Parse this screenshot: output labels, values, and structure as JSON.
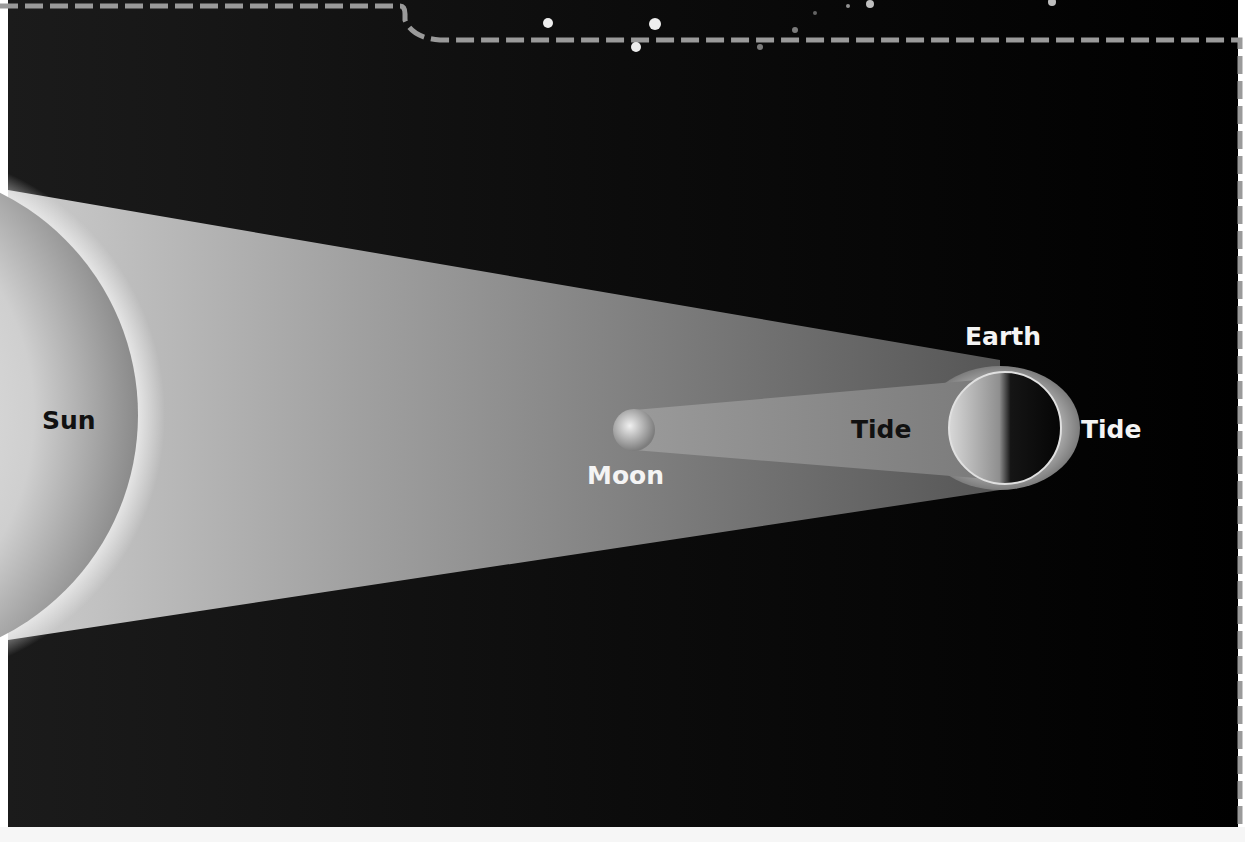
{
  "diagram": {
    "labels": {
      "sun": "Sun",
      "moon": "Moon",
      "earth": "Earth",
      "tide_near": "Tide",
      "tide_far": "Tide"
    },
    "colors": {
      "background": "#0a0a0a",
      "border_dash": "#9a9a9a",
      "sun_beam": "#9d9d9d",
      "moon_beam": "#8c8c8c",
      "tidal_bulge": "#a0a0a0",
      "label_dark": "#111111",
      "label_light": "#f4f4f4"
    }
  }
}
